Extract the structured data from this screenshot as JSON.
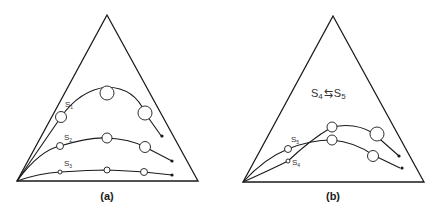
{
  "panels": [
    {
      "caption": "(a)",
      "curves": [
        {
          "label": "S",
          "sub": "1"
        },
        {
          "label": "S",
          "sub": "2"
        },
        {
          "label": "S",
          "sub": "3"
        }
      ]
    },
    {
      "caption": "(b)",
      "equilibrium": {
        "left": "S",
        "left_sub": "4",
        "arrow": "⇆",
        "right": "S",
        "right_sub": "5"
      },
      "curves": [
        {
          "label": "S",
          "sub": "5"
        },
        {
          "label": "S",
          "sub": "4"
        }
      ]
    }
  ]
}
